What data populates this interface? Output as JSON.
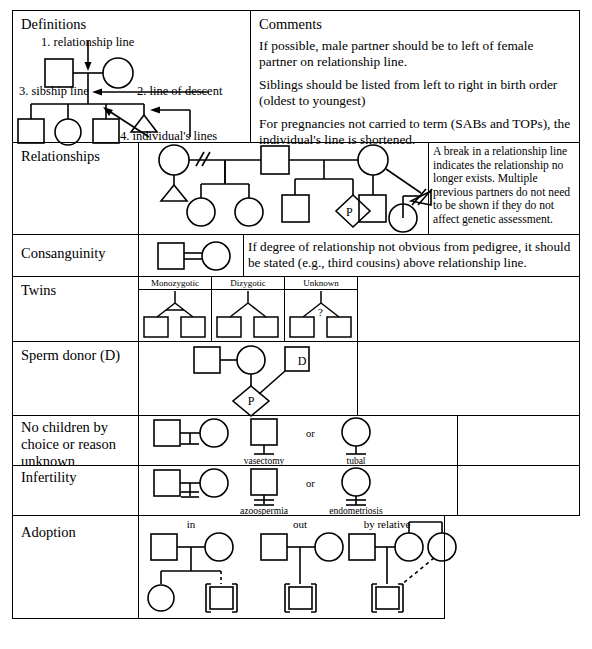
{
  "colors": {
    "ink": "#000000",
    "paper": "#ffffff"
  },
  "columns": {
    "definitions_header": "Definitions",
    "comments_header": "Comments"
  },
  "definitions": {
    "labels": [
      "1. relationship line",
      "2. line of descent",
      "3. sibship line",
      "4. individual's lines"
    ]
  },
  "comments": {
    "paragraphs": [
      "If possible, male partner should be to left of female partner on relationship line.",
      "Siblings should be listed from left to right in birth order (oldest to youngest)",
      "For pregnancies not carried to term (SABs and TOPs), the individual's line is shortened."
    ]
  },
  "rows": [
    {
      "label": "Relationships",
      "note": "A break in a relationship line indicates the relationship no longer exists. Multiple previous partners do not need to be shown if they do not affect genetic assessment.",
      "symbols": {
        "pregnancy": "P"
      }
    },
    {
      "label": "Consanguinity",
      "note": "If degree of relationship not obvious from pedigree, it should be stated (e.g., third cousins) above relationship line."
    },
    {
      "label": "Twins",
      "types": [
        {
          "name": "Monozygotic",
          "mark": ""
        },
        {
          "name": "Dizygotic",
          "mark": ""
        },
        {
          "name": "Unknown",
          "mark": "?"
        }
      ]
    },
    {
      "label": "Sperm donor (D)",
      "symbols": {
        "donor": "D",
        "pregnancy": "P"
      }
    },
    {
      "label": "No children by choice or reason unknown",
      "or_label": "or",
      "captions": [
        "vasectomy",
        "tubal"
      ]
    },
    {
      "label": "Infertility",
      "or_label": "or",
      "captions": [
        "azoospermia",
        "endometriosis"
      ]
    },
    {
      "label": "Adoption",
      "kinds": [
        "in",
        "out",
        "by relative"
      ]
    }
  ]
}
